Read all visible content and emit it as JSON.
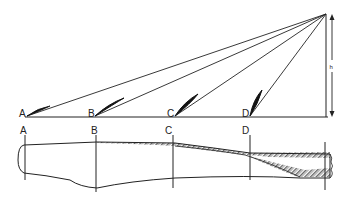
{
  "diagram": {
    "type": "propeller-blade-sections",
    "top_view": {
      "section_labels": [
        "A",
        "B",
        "C",
        "D"
      ],
      "pitch_arrow_label": "h"
    },
    "bottom_view": {
      "section_labels": [
        "A",
        "B",
        "C",
        "D"
      ]
    },
    "colors": {
      "line": "#222222",
      "background": "#ffffff"
    }
  }
}
